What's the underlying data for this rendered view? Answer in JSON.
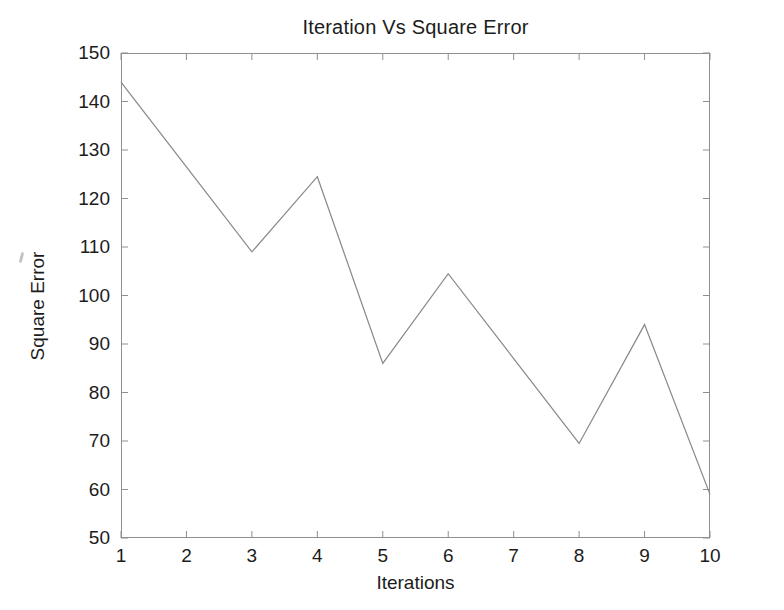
{
  "chart_data": {
    "type": "line",
    "title": "Iteration Vs Square Error",
    "xlabel": "Iterations",
    "ylabel": "Square Error",
    "x": [
      1,
      2,
      3,
      4,
      5,
      6,
      7,
      8,
      9,
      10
    ],
    "values": [
      144,
      126.5,
      109,
      124.5,
      86,
      104.5,
      87,
      69.5,
      94,
      59
    ],
    "series": [
      {
        "name": "Square Error",
        "values": [
          144,
          126.5,
          109,
          124.5,
          86,
          104.5,
          87,
          69.5,
          94,
          59
        ]
      }
    ],
    "xlim": [
      1,
      10
    ],
    "ylim": [
      50,
      150
    ],
    "xticks": [
      "1",
      "2",
      "3",
      "4",
      "5",
      "6",
      "7",
      "8",
      "9",
      "10"
    ],
    "yticks": [
      "50",
      "60",
      "70",
      "80",
      "90",
      "100",
      "110",
      "120",
      "130",
      "140",
      "150"
    ],
    "grid": false,
    "legend": null,
    "line_color": "#8a8a8a",
    "axis_color": "#8f8f8f",
    "background_color": "#ffffff"
  },
  "figure": {
    "title": "Iteration Vs Square Error",
    "x_axis_title": "Iterations",
    "y_axis_title": "Square Error"
  }
}
